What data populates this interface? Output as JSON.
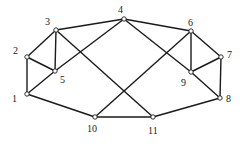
{
  "graph": {
    "nodes": [
      {
        "id": "1",
        "x": 27,
        "y": 94,
        "lx": 12,
        "ly": 94
      },
      {
        "id": "2",
        "x": 27,
        "y": 57,
        "lx": 13,
        "ly": 46
      },
      {
        "id": "3",
        "x": 56,
        "y": 30,
        "lx": 45,
        "ly": 17
      },
      {
        "id": "4",
        "x": 124,
        "y": 19,
        "lx": 118,
        "ly": 5
      },
      {
        "id": "5",
        "x": 55,
        "y": 71,
        "lx": 60,
        "ly": 75
      },
      {
        "id": "6",
        "x": 191,
        "y": 31,
        "lx": 188,
        "ly": 18
      },
      {
        "id": "7",
        "x": 221,
        "y": 57,
        "lx": 227,
        "ly": 50
      },
      {
        "id": "8",
        "x": 220,
        "y": 98,
        "lx": 226,
        "ly": 94
      },
      {
        "id": "9",
        "x": 191,
        "y": 72,
        "lx": 181,
        "ly": 78
      },
      {
        "id": "10",
        "x": 95,
        "y": 117,
        "lx": 87,
        "ly": 124
      },
      {
        "id": "11",
        "x": 153,
        "y": 117,
        "lx": 148,
        "ly": 126
      }
    ],
    "edges": [
      [
        "1",
        "2"
      ],
      [
        "1",
        "5"
      ],
      [
        "1",
        "10"
      ],
      [
        "2",
        "3"
      ],
      [
        "2",
        "5"
      ],
      [
        "3",
        "5"
      ],
      [
        "3",
        "4"
      ],
      [
        "3",
        "11"
      ],
      [
        "4",
        "5"
      ],
      [
        "4",
        "6"
      ],
      [
        "4",
        "9"
      ],
      [
        "6",
        "9"
      ],
      [
        "6",
        "7"
      ],
      [
        "6",
        "10"
      ],
      [
        "7",
        "9"
      ],
      [
        "7",
        "8"
      ],
      [
        "9",
        "8"
      ],
      [
        "8",
        "11"
      ],
      [
        "10",
        "11"
      ]
    ],
    "colors": {
      "edge": "#1a1a1a",
      "node_fill": "#ffffff",
      "node_stroke": "#1a1a1a"
    }
  }
}
